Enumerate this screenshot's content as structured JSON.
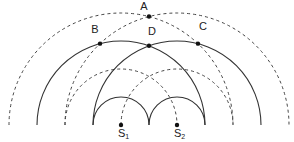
{
  "diagram": {
    "sources": [
      {
        "id": "S1",
        "label": "S",
        "subscript": "1"
      },
      {
        "id": "S2",
        "label": "S",
        "subscript": "2"
      }
    ],
    "points": [
      {
        "id": "A",
        "label": "A",
        "on": [
          "dashed-S1-2",
          "dashed-S2-2"
        ]
      },
      {
        "id": "B",
        "label": "B",
        "on": [
          "solid-S1-2",
          "dashed-S2-2"
        ]
      },
      {
        "id": "C",
        "label": "C",
        "on": [
          "solid-S2-2",
          "dashed-S1-2"
        ]
      },
      {
        "id": "D",
        "label": "D",
        "on": [
          "solid-S1-2",
          "solid-S2-2"
        ]
      }
    ],
    "wavefronts": {
      "solid_meaning": "crest",
      "dashed_meaning": "trough",
      "rings_per_source": [
        {
          "order": 1,
          "style": "solid"
        },
        {
          "order": 2,
          "style": "dashed"
        },
        {
          "order": 3,
          "style": "solid"
        },
        {
          "order": 4,
          "style": "dashed"
        }
      ]
    },
    "colors": {
      "stroke": "#333333",
      "background": "#ffffff"
    }
  }
}
